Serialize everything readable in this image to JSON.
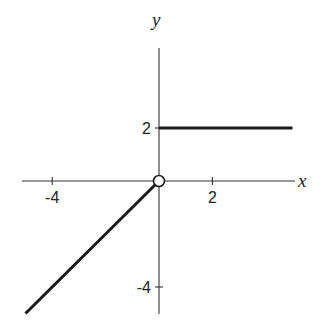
{
  "chart_data": {
    "type": "line",
    "title": "",
    "xlabel": "x",
    "ylabel": "y",
    "xlim": [
      -5,
      5
    ],
    "ylim": [
      -5,
      5
    ],
    "grid": false,
    "legend": null,
    "x_ticks": [
      {
        "value": -4,
        "label": "-4"
      },
      {
        "value": 2,
        "label": "2"
      }
    ],
    "y_ticks": [
      {
        "value": 2,
        "label": "2"
      },
      {
        "value": -4,
        "label": "-4"
      }
    ],
    "series": [
      {
        "name": "y = x (x < 0)",
        "points": [
          [
            -5,
            -5
          ],
          [
            0,
            0
          ]
        ],
        "end_marker": "open-circle"
      },
      {
        "name": "y = 2 (x >= 0)",
        "points": [
          [
            0,
            2
          ],
          [
            5,
            2
          ]
        ],
        "end_marker": "none"
      }
    ],
    "annotations": [
      {
        "type": "open-circle",
        "x": 0,
        "y": 0
      }
    ],
    "colors": {
      "line": "#1a1a1a",
      "axis": "#333333",
      "background": "#ffffff"
    }
  }
}
